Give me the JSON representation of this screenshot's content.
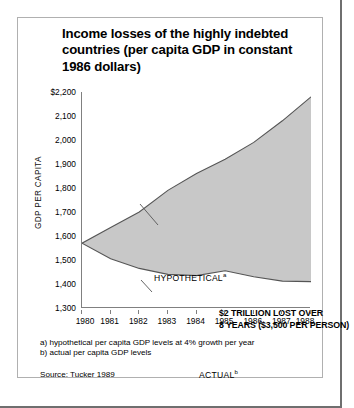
{
  "figure": {
    "title": "Income losses of the highly indebted countries (per capita GDP in constant 1986 dollars)",
    "footnote_a": "a) hypothetical per capita GDP levels at 4% growth per year",
    "footnote_b": "b) actual per capita GDP levels",
    "source": "Source: Tucker 1989",
    "annotation_line1": "$2 TRILLION LOST OVER",
    "annotation_line2": "8 YEARS ($3,500 PER PERSON)",
    "label_hypothetical": "HYPOTHETICAL",
    "label_hypothetical_marker": "a",
    "label_actual": "ACTUAL",
    "label_actual_marker": "b",
    "colors": {
      "fill": "#c8c8c8",
      "line": "#555555",
      "axis": "#808080",
      "frame": "#b0b0b0",
      "outer_frame": "#6f6f6f",
      "text": "#000000"
    }
  },
  "chart_data": {
    "type": "area",
    "title": "Income losses of the highly indebted countries (per capita GDP in constant 1986 dollars)",
    "xlabel": "",
    "ylabel": "GDP PER CAPITA",
    "x": [
      1980,
      1981,
      1982,
      1983,
      1984,
      1985,
      1986,
      1987,
      1988
    ],
    "xtick_labels": [
      "1980",
      "1981",
      "1982",
      "1983",
      "1984",
      "1985",
      "1986",
      "1987",
      "1988"
    ],
    "ytick_labels": [
      "$2,200",
      "2,100",
      "2,000",
      "1,900",
      "1,800",
      "1,700",
      "1,600",
      "1,500",
      "1,400",
      "1,300"
    ],
    "yticks": [
      2200,
      2100,
      2000,
      1900,
      1800,
      1700,
      1600,
      1500,
      1400,
      1300
    ],
    "ylim": [
      1300,
      2200
    ],
    "xlim": [
      1980,
      1988
    ],
    "grid": false,
    "legend": "inline-labels",
    "series": [
      {
        "name": "HYPOTHETICAL",
        "footnote": "a",
        "values": [
          1570,
          1635,
          1700,
          1790,
          1860,
          1920,
          1990,
          2080,
          2180
        ]
      },
      {
        "name": "ACTUAL",
        "footnote": "b",
        "values": [
          1570,
          1505,
          1465,
          1440,
          1435,
          1455,
          1430,
          1412,
          1410
        ]
      }
    ],
    "shaded_region": {
      "between": [
        "HYPOTHETICAL",
        "ACTUAL"
      ],
      "label": "$2 TRILLION LOST OVER 8 YEARS ($3,500 PER PERSON)"
    }
  }
}
